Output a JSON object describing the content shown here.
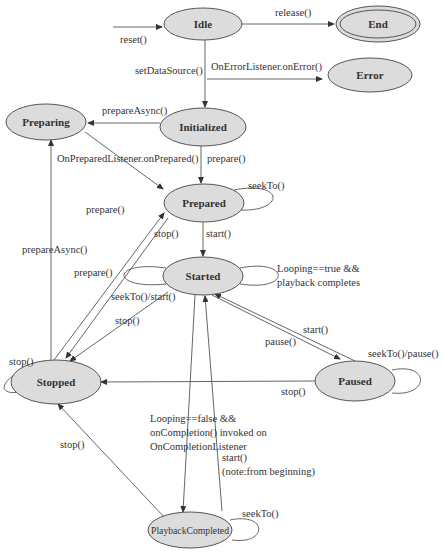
{
  "diagram": {
    "colors": {
      "state_fill": "#dcdcdc",
      "stroke": "#555555",
      "text": "#333333",
      "background": "#ffffff"
    },
    "states": [
      {
        "id": "idle",
        "label": "Idle",
        "cx": 203,
        "cy": 24,
        "rx": 39,
        "ry": 16
      },
      {
        "id": "end",
        "label": "End",
        "cx": 378,
        "cy": 24,
        "rx": 42,
        "ry": 18,
        "final": true
      },
      {
        "id": "error",
        "label": "Error",
        "cx": 370,
        "cy": 75,
        "rx": 42,
        "ry": 17
      },
      {
        "id": "preparing",
        "label": "Preparing",
        "cx": 46,
        "cy": 122,
        "rx": 40,
        "ry": 18
      },
      {
        "id": "initialized",
        "label": "Initialized",
        "cx": 203,
        "cy": 127,
        "rx": 43,
        "ry": 19
      },
      {
        "id": "prepared",
        "label": "Prepared",
        "cx": 204,
        "cy": 203,
        "rx": 40,
        "ry": 19
      },
      {
        "id": "started",
        "label": "Started",
        "cx": 203,
        "cy": 276,
        "rx": 40,
        "ry": 19
      },
      {
        "id": "stopped",
        "label": "Stopped",
        "cx": 56,
        "cy": 382,
        "rx": 45,
        "ry": 22
      },
      {
        "id": "paused",
        "label": "Paused",
        "cx": 355,
        "cy": 381,
        "rx": 40,
        "ry": 20
      },
      {
        "id": "playbackcompleted",
        "label": "PlaybackCompleted",
        "cx": 190,
        "cy": 530,
        "rx": 42,
        "ry": 18
      }
    ],
    "edges": [
      {
        "id": "reset",
        "label": "reset()",
        "path": "M113,27 L162,27",
        "arrow": true,
        "lx": 120,
        "ly": 43
      },
      {
        "id": "release",
        "label": "release()",
        "path": "M242,24 L334,24",
        "arrow": true,
        "lx": 275,
        "ly": 16
      },
      {
        "id": "setdatasource",
        "label": "setDataSource()",
        "path": "M205,40 L205,107",
        "arrow": true,
        "lx": 135,
        "ly": 74
      },
      {
        "id": "onerror",
        "label": "OnErrorListener.onError()",
        "path": "M207,79 L322,79",
        "arrow": true,
        "lx": 211,
        "ly": 70
      },
      {
        "id": "prepareasync-init",
        "label": "prepareAsync()",
        "path": "M160,123 L88,123",
        "arrow": true,
        "lx": 102,
        "ly": 114
      },
      {
        "id": "onprepared",
        "label": "OnPreparedListener.onPrepared()",
        "path": "M85,132 L163,189",
        "arrow": true,
        "lx": 57,
        "ly": 162
      },
      {
        "id": "prepare-init",
        "label": "prepare()",
        "path": "M201,146 L201,183",
        "arrow": true,
        "lx": 207,
        "ly": 162
      },
      {
        "id": "seekto-prepared",
        "label": "seekTo()",
        "path": "M234,190 C285,180 285,212 240,210",
        "arrow": false,
        "lx": 248,
        "ly": 189
      },
      {
        "id": "start-prepared",
        "label": "start()",
        "path": "M203,222 L203,256",
        "arrow": true,
        "lx": 206,
        "ly": 237
      },
      {
        "id": "prepare-stopped-text",
        "label": "prepare()",
        "path": "",
        "arrow": false,
        "lx": 86,
        "ly": 213
      },
      {
        "id": "stop-prepared",
        "label": "stop()",
        "path": "M168,218 L66,358",
        "arrow": true,
        "lx": 154,
        "ly": 237
      },
      {
        "id": "prepare-stopped",
        "label": "prepare()",
        "path": "M54,360 L164,213",
        "arrow": true,
        "lx": 74,
        "ly": 276
      },
      {
        "id": "prepareasync-stopped",
        "label": "prepareAsync()",
        "path": "M51,360 L51,140",
        "arrow": true,
        "lx": 22,
        "ly": 253
      },
      {
        "id": "seekto-start-started",
        "label": "seekTo()/start()",
        "path": "M166,268 C110,260 110,290 166,284",
        "arrow": false,
        "lx": 111,
        "ly": 300
      },
      {
        "id": "looping-true",
        "label": "Looping==true &&",
        "label2": "playback completes",
        "path": "M240,268 C290,258 292,292 240,284",
        "arrow": false,
        "lx": 277,
        "ly": 272
      },
      {
        "id": "stop-started",
        "label": "stop()",
        "path": "M168,292 L70,361",
        "arrow": true,
        "lx": 115,
        "ly": 324
      },
      {
        "id": "pause",
        "label": "pause()",
        "path": "M212,295 L340,359",
        "arrow": true,
        "lx": 265,
        "ly": 345
      },
      {
        "id": "start-paused",
        "label": "start()",
        "path": "M355,361 L215,294",
        "arrow": true,
        "lx": 303,
        "ly": 333
      },
      {
        "id": "seekto-pause-paused",
        "label": "seekTo()/pause()",
        "path": "M392,370 C430,362 430,397 392,393",
        "arrow": false,
        "lx": 368,
        "ly": 357
      },
      {
        "id": "stop-paused",
        "label": "stop()",
        "path": "M315,381 L101,382",
        "arrow": true,
        "lx": 281,
        "ly": 395
      },
      {
        "id": "stop-stopped",
        "label": "stop()",
        "path": "M14,375 C0,385 0,395 20,392",
        "arrow": false,
        "lx": 9,
        "ly": 365
      },
      {
        "id": "looping-false",
        "label": "Looping==false &&",
        "label2": "onCompletion() invoked on",
        "label3": "OnCompletionListener",
        "path": "M195,295 L183,512",
        "arrow": true,
        "lx": 150,
        "ly": 422
      },
      {
        "id": "start-completed",
        "label": "start()",
        "label2": "(note:from beginning)",
        "path": "M222,511 L205,296",
        "arrow": true,
        "lx": 222,
        "ly": 461
      },
      {
        "id": "stop-completed",
        "label": "stop()",
        "path": "M165,518 L58,404",
        "arrow": true,
        "lx": 60,
        "ly": 448
      },
      {
        "id": "seekto-completed",
        "label": "seekTo()",
        "path": "M230,520 C268,512 268,545 232,540",
        "arrow": false,
        "lx": 242,
        "ly": 517
      }
    ]
  }
}
